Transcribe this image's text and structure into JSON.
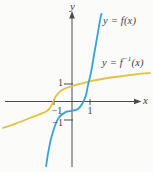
{
  "figure": {
    "y_axis_label": "y",
    "x_axis_label": "x",
    "f_label": "y = f(x)",
    "f_inverse_label": {
      "prefix": "y = f",
      "sup": "−1",
      "suffix": "(x)"
    },
    "colors": {
      "f_curve": "#35a3d5",
      "f_inverse_curve": "#e2c23c",
      "axis": "#4b4b4b",
      "text": "#3f3f3f",
      "background": "#fbfbf9"
    }
  },
  "chart_data": {
    "type": "line",
    "title": "",
    "xlabel": "x",
    "ylabel": "y",
    "grid": false,
    "legend_position": "inline-annotations",
    "xlim": [
      -3.9,
      4.6
    ],
    "ylim": [
      -3.9,
      5.0
    ],
    "x_ticks": [
      {
        "value": -1,
        "label": "−1"
      },
      {
        "value": 1,
        "label": "1"
      }
    ],
    "y_ticks": [
      {
        "value": -1,
        "label": "−1"
      },
      {
        "value": 1,
        "label": "1"
      }
    ],
    "series": [
      {
        "name": "y = f(x)",
        "color": "#35a3d5",
        "points": [
          [
            -1.44,
            -3.56
          ],
          [
            -1.28,
            -2.56
          ],
          [
            -1.06,
            -1.67
          ],
          [
            -0.78,
            -0.94
          ],
          [
            -0.39,
            -0.58
          ],
          [
            0,
            -0.49
          ],
          [
            0.33,
            -0.39
          ],
          [
            0.56,
            -0.11
          ],
          [
            0.78,
            0.39
          ],
          [
            0.89,
            0.94
          ],
          [
            1.06,
            1.67
          ],
          [
            1.22,
            2.61
          ],
          [
            1.39,
            3.56
          ],
          [
            1.56,
            4.56
          ],
          [
            1.64,
            4.89
          ]
        ]
      },
      {
        "name": "y = f⁻¹(x)",
        "color": "#e2c23c",
        "points": [
          [
            -3.83,
            -1.44
          ],
          [
            -3.44,
            -1.31
          ],
          [
            -2.89,
            -1.11
          ],
          [
            -2.33,
            -0.89
          ],
          [
            -1.78,
            -0.67
          ],
          [
            -1.44,
            -0.53
          ],
          [
            -1.22,
            -0.33
          ],
          [
            -1.06,
            -0.03
          ],
          [
            -0.89,
            0.33
          ],
          [
            -0.67,
            0.58
          ],
          [
            -0.39,
            0.75
          ],
          [
            0,
            0.89
          ],
          [
            0.56,
            1.04
          ],
          [
            1.11,
            1.17
          ],
          [
            1.67,
            1.28
          ],
          [
            2.39,
            1.39
          ],
          [
            3.33,
            1.51
          ],
          [
            4.33,
            1.62
          ]
        ]
      }
    ]
  }
}
